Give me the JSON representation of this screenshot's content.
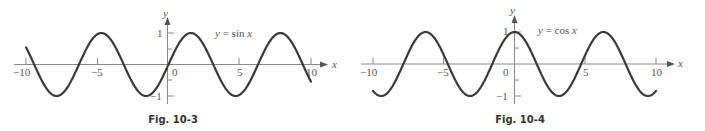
{
  "chart_data": [
    {
      "type": "line",
      "title": "",
      "function_label": "y = sin x",
      "caption": "Fig. 10-3",
      "xlabel": "x",
      "ylabel": "y",
      "xlim": [
        -10,
        10
      ],
      "ylim": [
        -1,
        1
      ],
      "x_ticks": [
        -10,
        -5,
        0,
        5,
        10
      ],
      "x_tick_labels": [
        "−10",
        "−5",
        "0",
        "5",
        "10"
      ],
      "y_ticks": [
        -1,
        -0.5,
        0.5,
        1
      ],
      "y_tick_labels": [
        "−1",
        "1"
      ],
      "grid": false,
      "series": [
        {
          "name": "sin x",
          "x": [
            -10,
            -9,
            -8,
            -7,
            -6,
            -5,
            -4,
            -3,
            -2,
            -1,
            0,
            1,
            2,
            3,
            4,
            5,
            6,
            7,
            8,
            9,
            10
          ],
          "values": [
            0.544,
            -0.412,
            -0.989,
            -0.657,
            0.279,
            0.959,
            0.757,
            -0.141,
            -0.909,
            -0.841,
            0,
            0.841,
            0.909,
            0.141,
            -0.757,
            -0.959,
            -0.279,
            0.657,
            0.989,
            0.412,
            -0.544
          ]
        }
      ]
    },
    {
      "type": "line",
      "title": "",
      "function_label": "y = cos x",
      "caption": "Fig. 10-4",
      "xlabel": "x",
      "ylabel": "y",
      "xlim": [
        -10,
        10
      ],
      "ylim": [
        -1,
        1
      ],
      "x_ticks": [
        -10,
        -5,
        0,
        5,
        10
      ],
      "x_tick_labels": [
        "−10",
        "−5",
        "0",
        "5",
        "10"
      ],
      "y_ticks": [
        -1,
        -0.5,
        0.5,
        1
      ],
      "y_tick_labels": [
        "−1",
        "1"
      ],
      "grid": false,
      "series": [
        {
          "name": "cos x",
          "x": [
            -10,
            -9,
            -8,
            -7,
            -6,
            -5,
            -4,
            -3,
            -2,
            -1,
            0,
            1,
            2,
            3,
            4,
            5,
            6,
            7,
            8,
            9,
            10
          ],
          "values": [
            -0.839,
            -0.911,
            -0.146,
            0.754,
            0.96,
            0.284,
            -0.654,
            -0.99,
            -0.416,
            0.54,
            1,
            0.54,
            -0.416,
            -0.99,
            -0.654,
            0.284,
            0.96,
            0.754,
            -0.146,
            -0.911,
            -0.839
          ]
        }
      ]
    }
  ],
  "figures": [
    {
      "caption": "Fig. 10-3",
      "func": "sin",
      "label_prefix": "y = ",
      "label_func": "sin",
      "label_var": "x",
      "x_axis_name": "x",
      "y_axis_name": "y",
      "x_tick_labels": [
        "−10",
        "−5",
        "0",
        "5",
        "10"
      ],
      "y_tick_top": "1",
      "y_tick_bottom": "−1"
    },
    {
      "caption": "Fig. 10-4",
      "func": "cos",
      "label_prefix": "y = ",
      "label_func": "cos",
      "label_var": "x",
      "x_axis_name": "x",
      "y_axis_name": "y",
      "x_tick_labels": [
        "−10",
        "−5",
        "0",
        "5",
        "10"
      ],
      "y_tick_top": "1",
      "y_tick_bottom": "−1"
    }
  ],
  "colors": {
    "curve": "#3a3a3a",
    "axis": "#8a8a8a",
    "text": "#555555"
  }
}
